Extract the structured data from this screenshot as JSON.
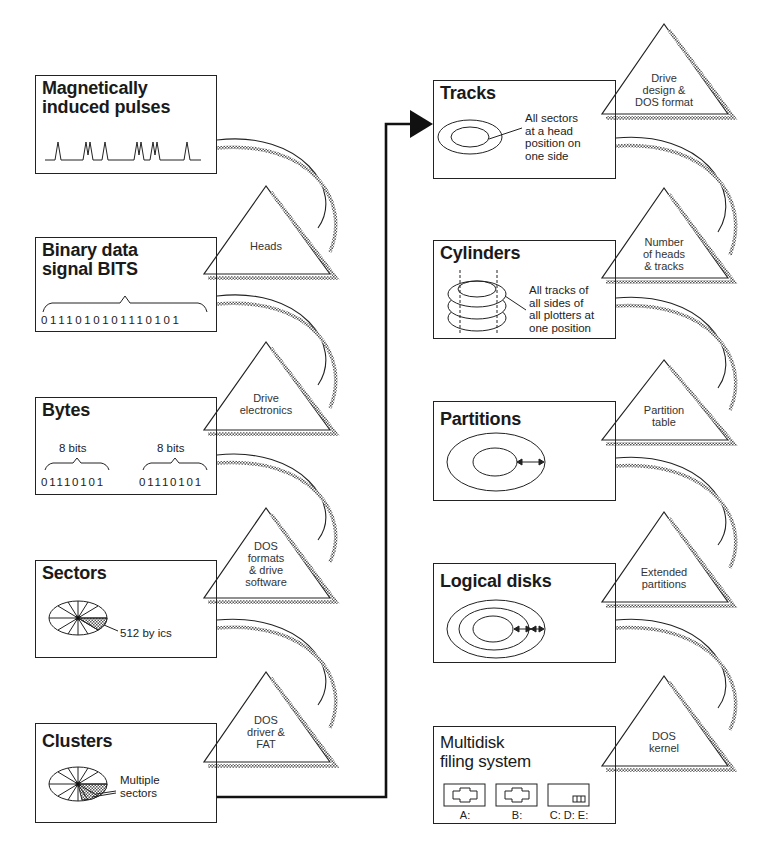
{
  "left_column": [
    {
      "id": "pulses",
      "title_lines": [
        "Magnetically",
        "induced pulses"
      ]
    },
    {
      "id": "bits",
      "title_lines": [
        "Binary data",
        "signal BITS"
      ],
      "bit_string": "0111010101110101"
    },
    {
      "id": "bytes",
      "title_lines": [
        "Bytes"
      ],
      "groups": [
        {
          "label": "8 bits",
          "value": "01110101"
        },
        {
          "label": "8 bits",
          "value": "01110101"
        }
      ]
    },
    {
      "id": "sectors",
      "title_lines": [
        "Sectors"
      ],
      "callout": "512 by ics"
    },
    {
      "id": "clusters",
      "title_lines": [
        "Clusters"
      ],
      "callout_lines": [
        "Multiple",
        "sectors"
      ]
    }
  ],
  "left_triangles": [
    {
      "id": "heads",
      "lines": [
        "Heads"
      ]
    },
    {
      "id": "drive-electronics",
      "lines": [
        "Drive",
        "electronics"
      ]
    },
    {
      "id": "dos-formats",
      "lines": [
        "DOS",
        "formats",
        "& drive",
        "software"
      ]
    },
    {
      "id": "dos-driver-fat",
      "lines": [
        "DOS",
        "driver &",
        "FAT"
      ]
    }
  ],
  "right_column": [
    {
      "id": "tracks",
      "title_lines": [
        "Tracks"
      ],
      "desc_lines": [
        "All sectors",
        "at a head",
        "position on",
        "one side"
      ]
    },
    {
      "id": "cylinders",
      "title_lines": [
        "Cylinders"
      ],
      "desc_lines": [
        "All tracks of",
        "all sides of",
        "all plotters at",
        "one position"
      ]
    },
    {
      "id": "partitions",
      "title_lines": [
        "Partitions"
      ]
    },
    {
      "id": "logical-disks",
      "title_lines": [
        "Logical disks"
      ]
    },
    {
      "id": "multidisk",
      "title_lines": [
        "Multidisk",
        "filing system"
      ],
      "drives": [
        "A:",
        "B:",
        "C: D: E:"
      ]
    }
  ],
  "right_triangles": [
    {
      "id": "drive-design",
      "lines": [
        "Drive",
        "design &",
        "DOS format"
      ]
    },
    {
      "id": "heads-tracks",
      "lines": [
        "Number",
        "of heads",
        "& tracks"
      ]
    },
    {
      "id": "partition-table",
      "lines": [
        "Partition",
        "table"
      ]
    },
    {
      "id": "extended-partitions",
      "lines": [
        "Extended",
        "partitions"
      ]
    },
    {
      "id": "dos-kernel",
      "lines": [
        "DOS",
        "kernel"
      ]
    }
  ],
  "colors": {
    "ink": "#222222",
    "background": "#ffffff",
    "shadow": "#777777"
  }
}
